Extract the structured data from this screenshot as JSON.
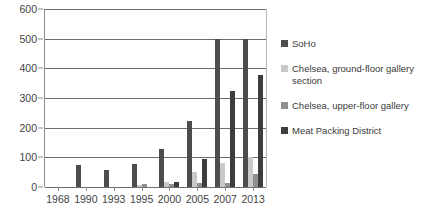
{
  "chart_data": {
    "type": "bar",
    "title": "",
    "subtitle": "",
    "xlabel": "",
    "ylabel": "",
    "ylim": [
      0,
      600
    ],
    "ytick_step": 100,
    "yticks": [
      600,
      500,
      400,
      300,
      200,
      100,
      0
    ],
    "grid": true,
    "grid_axis": "y",
    "legend_position": "right",
    "categories": [
      "1968",
      "1990",
      "1993",
      "1995",
      "2000",
      "2005",
      "2007",
      "2013"
    ],
    "series": [
      {
        "name": "SoHo",
        "color": "#4d4d4d",
        "values": [
          0,
          75,
          56,
          77,
          128,
          222,
          500,
          500
        ]
      },
      {
        "name": "Chelsea,  ground-floor gallery section",
        "color": "#c9c9c9",
        "values": [
          0,
          0,
          0,
          7,
          18,
          50,
          80,
          100
        ]
      },
      {
        "name": "Chelsea, upper-floor gallery",
        "color": "#8f8f8f",
        "values": [
          0,
          0,
          0,
          9,
          11,
          13,
          12,
          45
        ]
      },
      {
        "name": "Meat Packing District",
        "color": "#3d3d3d",
        "values": [
          0,
          0,
          0,
          0,
          16,
          94,
          323,
          378
        ]
      }
    ]
  },
  "legend": {
    "items": [
      {
        "label": "SoHo",
        "series_key": "s-soho"
      },
      {
        "label": "Chelsea,  ground-floor gallery section",
        "series_key": "s-ground"
      },
      {
        "label": "Chelsea, upper-floor gallery",
        "series_key": "s-upper"
      },
      {
        "label": "Meat Packing District",
        "series_key": "s-meat"
      }
    ]
  }
}
